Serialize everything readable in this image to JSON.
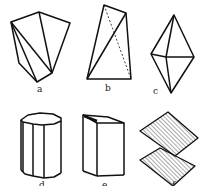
{
  "figure": {
    "type": "crystal-habit-diagram",
    "panels": [
      {
        "id": "a",
        "label": "a",
        "shape": "irregular polyhedron with triangular facets"
      },
      {
        "id": "b",
        "label": "b",
        "shape": "tetrahedral wedge with hidden dashed edge"
      },
      {
        "id": "c",
        "label": "c",
        "shape": "bipyramid"
      },
      {
        "id": "d",
        "label": "d",
        "shape": "octagonal prism"
      },
      {
        "id": "e",
        "label": "e",
        "shape": "rectangular prism"
      },
      {
        "id": "f",
        "label": "f",
        "shape": "two stacked hatched tabular plates"
      }
    ]
  },
  "colors": {
    "stroke": "#111111",
    "background": "#ffffff",
    "hatch": "#555555"
  }
}
